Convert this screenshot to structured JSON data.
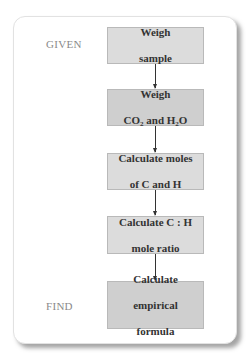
{
  "diagram": {
    "type": "flowchart",
    "labels": {
      "given": "GIVEN",
      "find": "FIND"
    },
    "steps": [
      {
        "id": "weigh-sample",
        "line1": "Weigh",
        "line2": "sample"
      },
      {
        "id": "weigh-co2-h2o",
        "line1": "Weigh",
        "line2_parts": [
          "CO",
          "2",
          " and H",
          "2",
          "O"
        ]
      },
      {
        "id": "calculate-moles",
        "line1": "Calculate moles",
        "line2": "of C and H"
      },
      {
        "id": "calculate-ratio",
        "line1": "Calculate C : H",
        "line2": "mole ratio"
      },
      {
        "id": "calculate-formula",
        "line1": "Calculate",
        "line2": "empirical",
        "line3": "formula"
      }
    ],
    "colors": {
      "box_fill": "#dcdcdc",
      "box_border": "#b9b9b9",
      "label_text": "#8a8a8a",
      "box_text": "#333333",
      "arrow": "#333333"
    }
  }
}
